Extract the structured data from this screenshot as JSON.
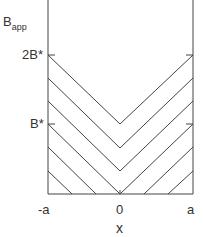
{
  "diagram": {
    "y_label": "B",
    "y_label_sub": "app",
    "y_ticks": [
      "2B*",
      "B*"
    ],
    "x_ticks": [
      "-a",
      "0",
      "a"
    ],
    "x_label": "x",
    "line_color": "#444444"
  }
}
